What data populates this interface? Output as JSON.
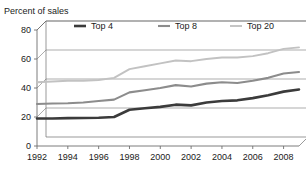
{
  "chart_data": {
    "type": "line",
    "title": "Percent of sales",
    "xlabel": "",
    "ylabel": "Percent of sales",
    "ylim": [
      0,
      80
    ],
    "yticks": [
      0,
      20,
      40,
      60,
      80
    ],
    "xlim": [
      1992,
      2009
    ],
    "xticks": [
      1992,
      1994,
      1996,
      1998,
      2000,
      2002,
      2004,
      2006,
      2008
    ],
    "xtick_labels": [
      "1992",
      "1994",
      "1996",
      "1998",
      "2000",
      "2002",
      "2004",
      "2006",
      "2008"
    ],
    "ytick_labels": [
      "0",
      "20",
      "40",
      "60",
      "80"
    ],
    "grid": true,
    "legend_position": "top",
    "x": [
      1992,
      1993,
      1994,
      1995,
      1996,
      1997,
      1998,
      1999,
      2000,
      2001,
      2002,
      2003,
      2004,
      2005,
      2006,
      2007,
      2008,
      2009
    ],
    "series": [
      {
        "name": "Top 4",
        "color": "#3b3b3b",
        "width": 2.6,
        "values": [
          19,
          19,
          19.2,
          19.3,
          19.5,
          20,
          25,
          26,
          27,
          28.5,
          28,
          30,
          31,
          31.5,
          33,
          35,
          37.5,
          39
        ]
      },
      {
        "name": "Top 8",
        "color": "#8c8c8c",
        "width": 2.1,
        "values": [
          29,
          29.3,
          29.5,
          30,
          31,
          32,
          37,
          38.5,
          40,
          42,
          41,
          43,
          44,
          43.5,
          45,
          47,
          50,
          51
        ]
      },
      {
        "name": "Top 20",
        "color": "#c2c2c2",
        "width": 1.9,
        "values": [
          44,
          44.5,
          45,
          45,
          45.5,
          47,
          53,
          55,
          57,
          59,
          58.5,
          60,
          61,
          61,
          62,
          64,
          67,
          68
        ]
      }
    ],
    "legend": [
      {
        "label": "Top 4",
        "color": "#3b3b3b"
      },
      {
        "label": "Top 8",
        "color": "#8c8c8c"
      },
      {
        "label": "Top 20",
        "color": "#c2c2c2"
      }
    ],
    "axis_color": "#6e6e6e",
    "grid_color": "#8a8a8a",
    "background": "#ffffff"
  }
}
